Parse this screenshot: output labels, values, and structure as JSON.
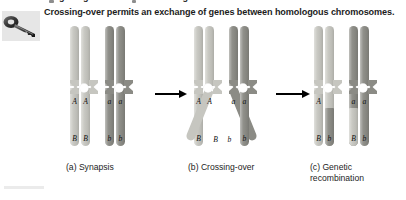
{
  "figure": {
    "caption": "Crossing-over permits an exchange of genes between homologous chromosomes.",
    "clipped_header_text": "exchange of genes between homologous",
    "key_icon": "key-icon",
    "background_color": "#ffffff",
    "colors": {
      "light_chromatid": "#c6c6c0",
      "dark_chromatid": "#8b8b85",
      "arrow": "#000000",
      "text": "#1c1c1c",
      "icon_panel": "#e6e6e6"
    }
  },
  "panels": [
    {
      "id": "a",
      "caption": "(a) Synapsis",
      "chromosomes": [
        {
          "name": "maternal-homolog",
          "shade": "light",
          "chromatids": [
            {
              "upper_allele": "A",
              "lower_allele": "B",
              "upper_shade": "light",
              "lower_shade": "light"
            },
            {
              "upper_allele": "A",
              "lower_allele": "B",
              "upper_shade": "light",
              "lower_shade": "light"
            }
          ]
        },
        {
          "name": "paternal-homolog",
          "shade": "dark",
          "chromatids": [
            {
              "upper_allele": "a",
              "lower_allele": "b",
              "upper_shade": "dark",
              "lower_shade": "dark"
            },
            {
              "upper_allele": "a",
              "lower_allele": "b",
              "upper_shade": "dark",
              "lower_shade": "dark"
            }
          ]
        }
      ]
    },
    {
      "id": "b",
      "caption": "(b) Crossing-over",
      "chromosomes": [
        {
          "name": "maternal-homolog",
          "shade": "light",
          "chromatids": [
            {
              "upper_allele": "A",
              "lower_allele": "B",
              "upper_shade": "light",
              "lower_shade": "light"
            },
            {
              "upper_allele": "A",
              "lower_allele": "b",
              "upper_shade": "light",
              "lower_shade": "light",
              "crossing": true
            }
          ]
        },
        {
          "name": "paternal-homolog",
          "shade": "dark",
          "chromatids": [
            {
              "upper_allele": "a",
              "lower_allele": "B",
              "upper_shade": "dark",
              "lower_shade": "dark",
              "crossing": true
            },
            {
              "upper_allele": "a",
              "lower_allele": "b",
              "upper_shade": "dark",
              "lower_shade": "dark"
            }
          ]
        }
      ]
    },
    {
      "id": "c",
      "caption": "(c) Genetic\nrecombination",
      "chromosomes": [
        {
          "name": "recombinant-maternal-homolog",
          "shade": "light",
          "chromatids": [
            {
              "upper_allele": "A",
              "lower_allele": "B",
              "upper_shade": "light",
              "lower_shade": "light"
            },
            {
              "upper_allele": "",
              "lower_allele": "b",
              "upper_shade": "light",
              "lower_shade": "dark",
              "recombinant": true
            }
          ]
        },
        {
          "name": "recombinant-paternal-homolog",
          "shade": "dark",
          "chromatids": [
            {
              "upper_allele": "a",
              "lower_allele": "B",
              "upper_shade": "dark",
              "lower_shade": "light",
              "recombinant": true
            },
            {
              "upper_allele": "a",
              "lower_allele": "b",
              "upper_shade": "dark",
              "lower_shade": "dark"
            }
          ]
        }
      ]
    }
  ],
  "arrows": [
    {
      "name": "arrow-a-to-b",
      "direction": "right"
    },
    {
      "name": "arrow-b-to-c",
      "direction": "right"
    }
  ]
}
